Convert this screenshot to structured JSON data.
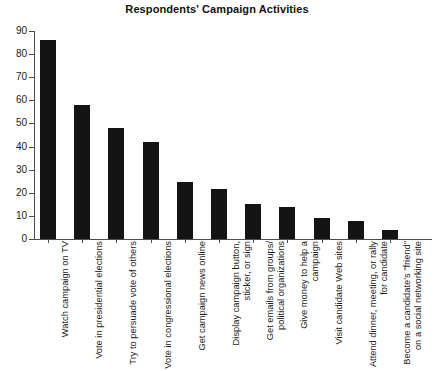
{
  "chart_data": {
    "type": "bar",
    "title": "Respondents' Campaign Activities",
    "xlabel": "",
    "ylabel": "",
    "ylim": [
      0,
      90
    ],
    "yticks": [
      0,
      10,
      20,
      30,
      40,
      50,
      60,
      70,
      80,
      90
    ],
    "grid": false,
    "legend": null,
    "bar_color": "#141414",
    "categories": [
      "Watch campaign on TV",
      "Vote in presidential elections",
      "Try to persuade vote of others",
      "Vote in congressional elections",
      "Get campaign news online",
      "Display campaign button, sticker, or sign",
      "Get emails from groups/ political organizations",
      "Give money to help a campaign",
      "Visit candidate Web sites",
      "Attend dinner, meeting, or rally for candidate",
      "Become a candidate's \"friend\" on a social networking site"
    ],
    "values": [
      86,
      58,
      48,
      42,
      24.5,
      21.5,
      15,
      14,
      9,
      8,
      4
    ]
  }
}
